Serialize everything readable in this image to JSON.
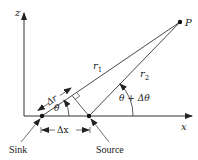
{
  "diagram": {
    "axes": {
      "z_label": "z",
      "x_label": "x"
    },
    "points": {
      "P": "P",
      "sink": "Sink",
      "source": "Source"
    },
    "distances": {
      "r1": "r",
      "r1_sub": "1",
      "r2": "r",
      "r2_sub": "2",
      "delta_r": "Δr",
      "delta_x": "Δx"
    },
    "angles": {
      "theta": "θ",
      "theta_plus_delta": "θ + Δθ"
    },
    "colors": {
      "line": "#333333",
      "text": "#1a1a1a",
      "background": "#ffffff"
    }
  }
}
